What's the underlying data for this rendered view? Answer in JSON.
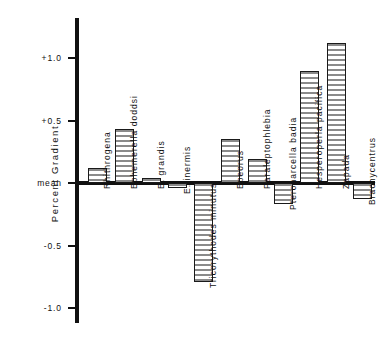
{
  "figure": {
    "background_color": "#ffffff",
    "axis_color": "#111111",
    "bar_fill_color": "#8a8a8a",
    "bar_outline_color": "#1a1a1a"
  },
  "axis": {
    "y_title": "Percent Gradient",
    "ticks": [
      {
        "label": "+1.0",
        "value": 1.0
      },
      {
        "label": "+0.5",
        "value": 0.5
      },
      {
        "label": "mean",
        "value": 0.0
      },
      {
        "label": "-0.5",
        "value": -0.5
      },
      {
        "label": "-1.0",
        "value": -1.0
      }
    ]
  },
  "chart_data": {
    "type": "bar",
    "title": "",
    "subtitle": "",
    "xlabel": "",
    "ylabel": "Percent Gradient",
    "ylim": [
      -1.25,
      1.3
    ],
    "grid": false,
    "legend": null,
    "orientation": "vertical",
    "baseline_label": "mean",
    "categories": [
      "Rhithrogena",
      "Ephemerella doddsi",
      "E. grandis",
      "E. inermis",
      "Tricorythodes minutus",
      "Epeorus",
      "Paraleptophlebia",
      "Pteronarcella badia",
      "Hesperoperla pacifica",
      "Zapada",
      "Brachycentrus"
    ],
    "values": [
      0.12,
      0.43,
      0.04,
      -0.04,
      -0.79,
      0.35,
      0.19,
      -0.17,
      0.9,
      1.12,
      -0.13
    ],
    "series": [
      {
        "name": "Percent Gradient",
        "values": [
          0.12,
          0.43,
          0.04,
          -0.04,
          -0.79,
          0.35,
          0.19,
          -0.17,
          0.9,
          1.12,
          -0.13
        ]
      }
    ]
  },
  "bars": [
    {
      "label": "Rhithrogena",
      "value": 0.12,
      "x": 88,
      "width": 19
    },
    {
      "label": "Ephemerella doddsi",
      "value": 0.43,
      "x": 115,
      "width": 19
    },
    {
      "label": "E. grandis",
      "value": 0.04,
      "x": 142,
      "width": 19
    },
    {
      "label": "E. inermis",
      "value": -0.04,
      "x": 168,
      "width": 19
    },
    {
      "label": "Tricorythodes minutus",
      "value": -0.79,
      "x": 194,
      "width": 19
    },
    {
      "label": "Epeorus",
      "value": 0.35,
      "x": 221,
      "width": 19
    },
    {
      "label": "Paraleptophlebia",
      "value": 0.19,
      "x": 248,
      "width": 19
    },
    {
      "label": "Pteronarcella badia",
      "value": -0.17,
      "x": 274,
      "width": 19
    },
    {
      "label": "Hesperoperla pacifica",
      "value": 0.9,
      "x": 300,
      "width": 19
    },
    {
      "label": "Zapada",
      "value": 1.12,
      "x": 327,
      "width": 19
    },
    {
      "label": "Brachycentrus",
      "value": -0.13,
      "x": 353,
      "width": 19
    }
  ]
}
